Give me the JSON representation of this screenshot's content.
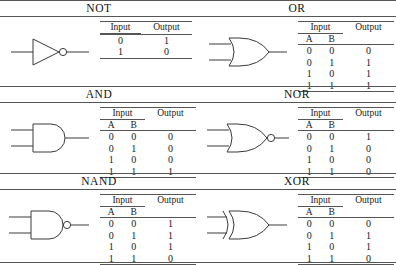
{
  "figure": {
    "headers": {
      "input": "Input",
      "output": "Output",
      "a": "A",
      "b": "B"
    }
  },
  "gates": [
    {
      "name": "NOT",
      "symbol": "not-gate-symbol",
      "inputs": 1,
      "rows": [
        {
          "a": "0",
          "out": "1"
        },
        {
          "a": "1",
          "out": "0"
        }
      ]
    },
    {
      "name": "OR",
      "symbol": "or-gate-symbol",
      "inputs": 2,
      "rows": [
        {
          "a": "0",
          "b": "0",
          "out": "0"
        },
        {
          "a": "0",
          "b": "1",
          "out": "1"
        },
        {
          "a": "1",
          "b": "0",
          "out": "1"
        },
        {
          "a": "1",
          "b": "1",
          "out": "1"
        }
      ]
    },
    {
      "name": "AND",
      "symbol": "and-gate-symbol",
      "inputs": 2,
      "rows": [
        {
          "a": "0",
          "b": "0",
          "out": "0"
        },
        {
          "a": "0",
          "b": "1",
          "out": "0"
        },
        {
          "a": "1",
          "b": "0",
          "out": "0"
        },
        {
          "a": "1",
          "b": "1",
          "out": "1"
        }
      ]
    },
    {
      "name": "NOR",
      "symbol": "nor-gate-symbol",
      "inputs": 2,
      "rows": [
        {
          "a": "0",
          "b": "0",
          "out": "1"
        },
        {
          "a": "0",
          "b": "1",
          "out": "0"
        },
        {
          "a": "1",
          "b": "0",
          "out": "0"
        },
        {
          "a": "1",
          "b": "1",
          "out": "0"
        }
      ]
    },
    {
      "name": "NAND",
      "symbol": "nand-gate-symbol",
      "inputs": 2,
      "rows": [
        {
          "a": "0",
          "b": "0",
          "out": "1"
        },
        {
          "a": "0",
          "b": "1",
          "out": "1"
        },
        {
          "a": "1",
          "b": "0",
          "out": "1"
        },
        {
          "a": "1",
          "b": "1",
          "out": "0"
        }
      ]
    },
    {
      "name": "XOR",
      "symbol": "xor-gate-symbol",
      "inputs": 2,
      "rows": [
        {
          "a": "0",
          "b": "0",
          "out": "0"
        },
        {
          "a": "0",
          "b": "1",
          "out": "1"
        },
        {
          "a": "1",
          "b": "0",
          "out": "1"
        },
        {
          "a": "1",
          "b": "1",
          "out": "0"
        }
      ]
    }
  ],
  "colors": {
    "ink": "#1a1a1a",
    "rule": "#555555",
    "symbol_stroke": "#3a3a3a"
  }
}
